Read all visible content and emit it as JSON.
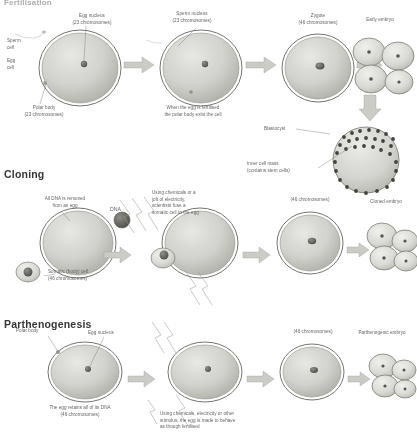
{
  "document": {
    "type": "biology-diagram",
    "subject": "Reproduction and embryo formation",
    "background_color": "#ffffff",
    "ink_color": "#5a5a5a"
  },
  "sections": [
    {
      "id": "fertilisation",
      "title": "Fertilisation",
      "stages": [
        {
          "id": "egg-before",
          "labels": [
            {
              "id": "sperm-cell",
              "text": "Sperm\ncell"
            },
            {
              "id": "egg-cell",
              "text": "Egg\ncell"
            },
            {
              "id": "egg-nucleus",
              "text": "Egg nucleus\n(23 chromosomes)"
            },
            {
              "id": "polar-body",
              "text": "Polar body\n(23 chromosomes)"
            }
          ]
        },
        {
          "id": "egg-fertilised",
          "labels": [
            {
              "id": "sperm-nucleus",
              "text": "Sperm nucleus\n(23 chromosomes)"
            },
            {
              "id": "polar-body-exit",
              "text": "When the egg is fertilised\nthe polar body exits the cell"
            }
          ]
        },
        {
          "id": "zygote",
          "labels": [
            {
              "id": "zygote",
              "text": "Zygote\n(46 chromosomes)"
            }
          ]
        },
        {
          "id": "early-embryo",
          "labels": [
            {
              "id": "early-embryo",
              "text": "Early embryo"
            },
            {
              "id": "blastocyst",
              "text": "Blastocyst"
            },
            {
              "id": "inner-cell-mass",
              "text": "Inner cell mass\n(contains stem cells)"
            }
          ]
        }
      ]
    },
    {
      "id": "cloning",
      "title": "Cloning",
      "stages": [
        {
          "id": "enucleated-egg",
          "labels": [
            {
              "id": "dna-removed",
              "text": "All DNA is removed\nfrom an egg"
            },
            {
              "id": "dna",
              "text": "DNA"
            }
          ]
        },
        {
          "id": "fusion",
          "labels": [
            {
              "id": "fusion-caption",
              "text": "Using chemicals or a\njolt of electricity,\nscientists fuse a\nsomatic cell to the egg"
            },
            {
              "id": "somatic-cell",
              "text": "Somatic (body) cell\n(46 chromosomes)"
            }
          ]
        },
        {
          "id": "cloned-zygote",
          "labels": [
            {
              "id": "cloned-chromosomes",
              "text": "(46 chromosomes)"
            }
          ]
        },
        {
          "id": "cloned-embryo",
          "labels": [
            {
              "id": "cloned-embryo",
              "text": "Cloned embryo"
            }
          ]
        }
      ]
    },
    {
      "id": "parthenogenesis",
      "title": "Parthenogenesis",
      "stages": [
        {
          "id": "egg-retains-dna",
          "labels": [
            {
              "id": "polar-body-p",
              "text": "Polar body"
            },
            {
              "id": "egg-nucleus-p",
              "text": "Egg nucleus"
            },
            {
              "id": "retains-dna",
              "text": "The egg retains all of its DNA\n(46 chromosomes)"
            }
          ]
        },
        {
          "id": "stimulated-egg",
          "labels": [
            {
              "id": "stimulus-caption",
              "text": "Using chemicals, electricity or other\nstimulus, the egg is made to behave\nas though fertilised"
            }
          ]
        },
        {
          "id": "parthenogenic-zygote",
          "labels": [
            {
              "id": "partheno-chromosomes",
              "text": "(46 chromosomes)"
            }
          ]
        },
        {
          "id": "parthenogenic-embryo",
          "labels": [
            {
              "id": "parthenogenic-embryo",
              "text": "Parthenogenic embryo"
            }
          ]
        }
      ]
    }
  ],
  "labels": {
    "fertilisation_title": "Fertilisation",
    "cloning_title": "Cloning",
    "parthenogenesis_title": "Parthenogenesis",
    "sperm_cell": "Sperm\ncell",
    "egg_cell": "Egg\ncell",
    "egg_nucleus": "Egg nucleus\n(23 chromosomes)",
    "polar_body": "Polar body\n(23 chromosomes)",
    "sperm_nucleus": "Sperm nucleus\n(23 chromosomes)",
    "polar_body_exit": "When the egg is fertilised\nthe polar body exits the cell",
    "zygote": "Zygote\n(46 chromosomes)",
    "early_embryo": "Early embryo",
    "blastocyst": "Blastocyst",
    "inner_cell_mass": "Inner cell mass\n(contains stem cells)",
    "dna_removed": "All DNA is removed\nfrom an egg",
    "dna": "DNA",
    "fusion_caption": "Using chemicals or a\njolt of electricity,\nscientists fuse a\nsomatic cell to the egg",
    "somatic_cell": "Somatic (body) cell\n(46 chromosomes)",
    "chromosomes_46_clone": "(46 chromosomes)",
    "cloned_embryo": "Cloned embryo",
    "polar_body_p": "Polar body",
    "egg_nucleus_p": "Egg nucleus",
    "retains_dna": "The egg retains all of its DNA\n(46 chromosomes)",
    "stimulus_caption": "Using chemicals, electricity or other\nstimulus, the egg is made to behave\nas though fertilised",
    "chromosomes_46_partheno": "(46 chromosomes)",
    "parthenogenic_embryo": "Parthenogenic embryo"
  }
}
